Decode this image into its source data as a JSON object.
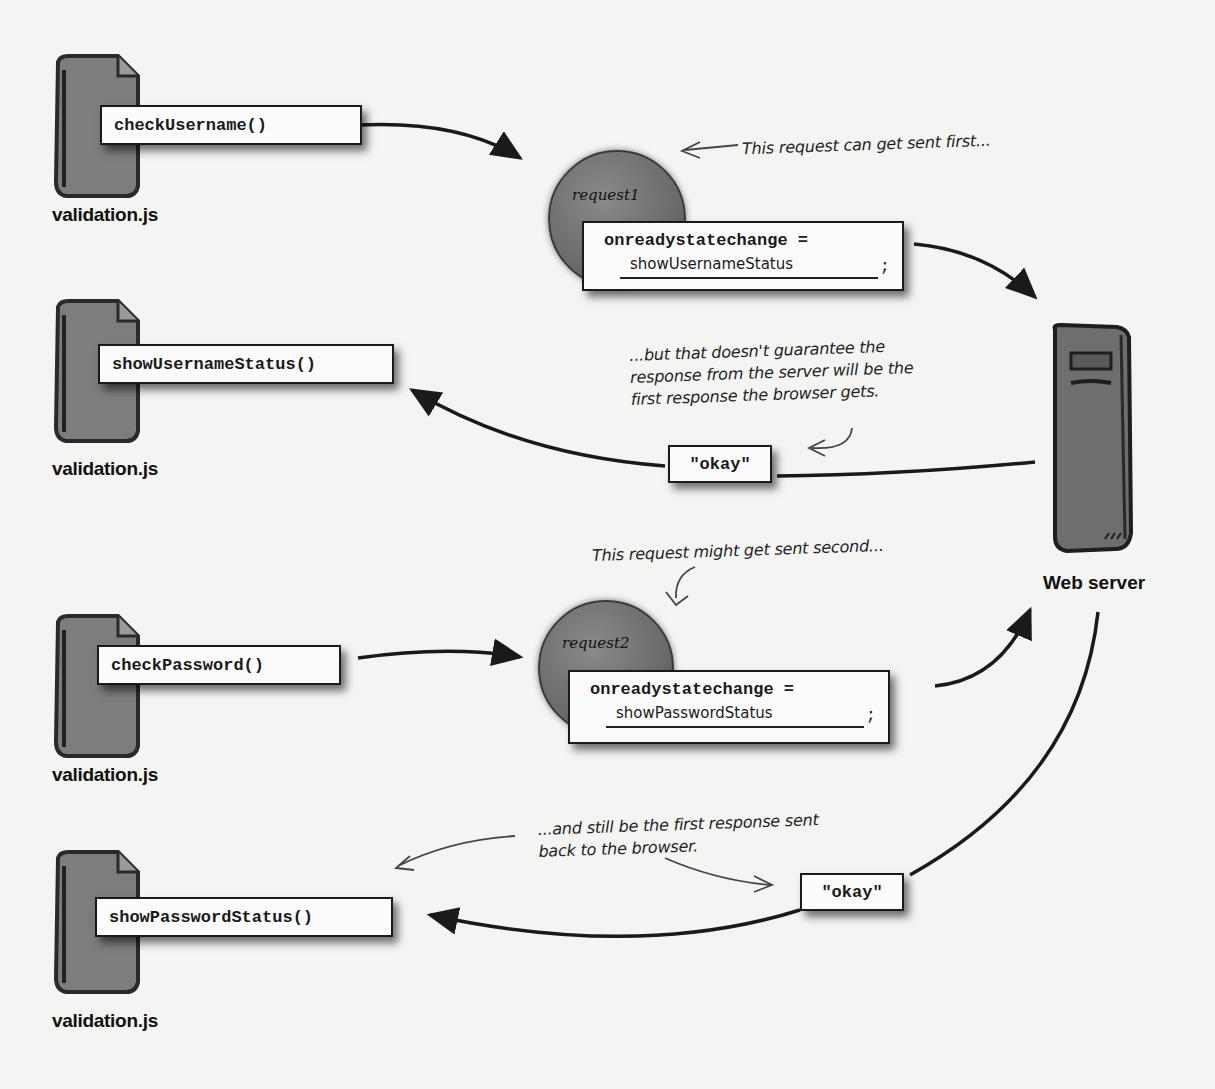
{
  "files": [
    {
      "label": "validation.js",
      "function": "checkUsername()"
    },
    {
      "label": "validation.js",
      "function": "showUsernameStatus()"
    },
    {
      "label": "validation.js",
      "function": "checkPassword()"
    },
    {
      "label": "validation.js",
      "function": "showPasswordStatus()"
    }
  ],
  "file_icon_scribbles": [
    "windo",
    "writeader=..."
  ],
  "requests": [
    {
      "name": "request1",
      "assignment": "onreadystatechange =",
      "handler": "showUsernameStatus",
      "terminator": ";"
    },
    {
      "name": "request2",
      "assignment": "onreadystatechange =",
      "handler": "showPasswordStatus",
      "terminator": ";"
    }
  ],
  "responses": [
    {
      "value": "\"okay\""
    },
    {
      "value": "\"okay\""
    }
  ],
  "server": {
    "label": "Web server"
  },
  "notes": {
    "sent_first": "This request can get sent first...",
    "no_guarantee": [
      "...but that doesn't guarantee the",
      "response from the server will be the",
      "first response the browser gets."
    ],
    "sent_second": "This request might get sent second...",
    "still_first": [
      "...and still be the first response sent",
      "back to the browser."
    ]
  },
  "colors": {
    "background": "#f4f4f3",
    "ink": "#1a1a1a",
    "icon_gray": "#7a7a7a",
    "box_fill": "#fbfbfb"
  }
}
